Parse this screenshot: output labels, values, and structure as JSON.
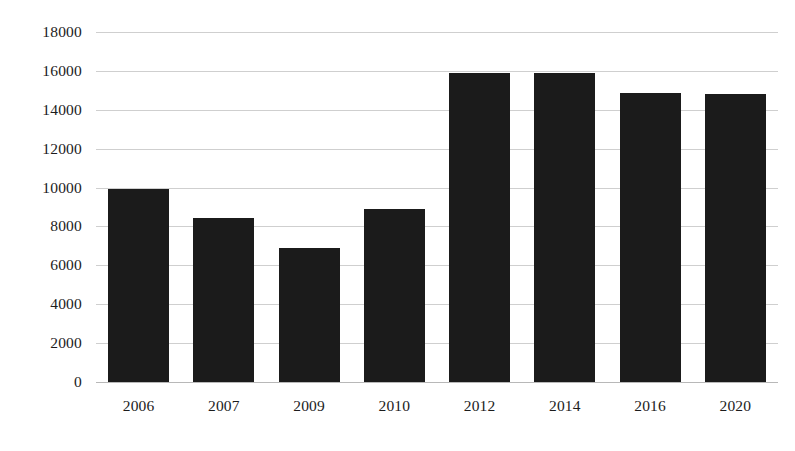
{
  "chart_data": {
    "type": "bar",
    "title": "",
    "subtitle": "",
    "xlabel": "",
    "ylabel": "",
    "categories": [
      "2006",
      "2007",
      "2009",
      "2010",
      "2012",
      "2014",
      "2016",
      "2020"
    ],
    "values": [
      9950,
      8430,
      6870,
      8900,
      15900,
      15870,
      14850,
      14830
    ],
    "series": [
      {
        "name": "",
        "values": [
          9950,
          8430,
          6870,
          8900,
          15900,
          15870,
          14850,
          14830
        ]
      }
    ],
    "ylim": [
      0,
      18000
    ],
    "ytick_step": 2000,
    "ytick_labels": [
      "18000",
      "16000",
      "14000",
      "12000",
      "10000",
      "8000",
      "6000",
      "4000",
      "2000",
      "0"
    ],
    "ytick_values": [
      18000,
      16000,
      14000,
      12000,
      10000,
      8000,
      6000,
      4000,
      2000,
      0
    ],
    "grid": true,
    "grid_axis": "y",
    "legend": false,
    "legend_position": "none",
    "bar_color": "#1b1b1b",
    "gridline_color": "#cfcfcf",
    "background_color": "#ffffff",
    "annotations": []
  }
}
